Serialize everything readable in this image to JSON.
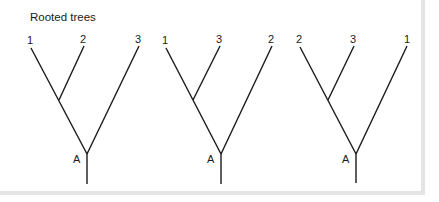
{
  "title": "Rooted trees",
  "trees": [
    {
      "leaves": [
        "1",
        "2",
        "3"
      ],
      "root_label": "A"
    },
    {
      "leaves": [
        "1",
        "3",
        "2"
      ],
      "root_label": "A"
    },
    {
      "leaves": [
        "2",
        "3",
        "1"
      ],
      "root_label": "A"
    }
  ],
  "colors": {
    "line": "#1a1a1a",
    "frame": "#e4e4e4"
  }
}
